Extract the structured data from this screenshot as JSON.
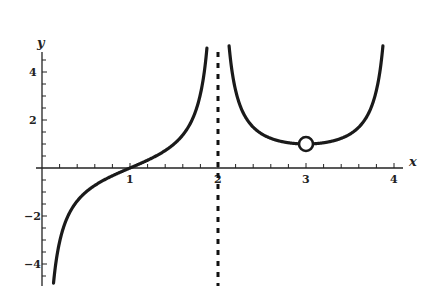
{
  "chart_data": {
    "type": "line",
    "title": "",
    "xlabel": "x",
    "ylabel": "y",
    "xlim": [
      0,
      4.1
    ],
    "ylim": [
      -5,
      5
    ],
    "grid": false,
    "x_ticks": [
      1,
      2,
      3,
      4
    ],
    "x_tick_labels": [
      "1",
      "2",
      "3",
      "4"
    ],
    "y_ticks": [
      -4,
      -2,
      2,
      4
    ],
    "y_tick_labels": [
      "-4",
      "-2",
      "2",
      "4"
    ],
    "series": [
      {
        "name": "left branch",
        "domain": [
          0,
          2
        ],
        "points": [
          [
            0.04,
            -5.0
          ],
          [
            0.1,
            -6.31
          ],
          [
            0.2,
            -3.08
          ],
          [
            0.3,
            -1.96
          ],
          [
            0.4,
            -1.38
          ],
          [
            0.5,
            -1.0
          ],
          [
            0.6,
            -0.73
          ],
          [
            0.7,
            -0.51
          ],
          [
            0.8,
            -0.32
          ],
          [
            0.9,
            -0.16
          ],
          [
            1.0,
            0.0
          ],
          [
            1.1,
            0.16
          ],
          [
            1.2,
            0.32
          ],
          [
            1.3,
            0.51
          ],
          [
            1.4,
            0.73
          ],
          [
            1.5,
            1.0
          ],
          [
            1.6,
            1.38
          ],
          [
            1.7,
            1.96
          ],
          [
            1.8,
            3.08
          ],
          [
            1.86,
            4.5
          ],
          [
            1.88,
            5.0
          ]
        ]
      },
      {
        "name": "right branch",
        "domain": [
          2,
          4
        ],
        "points": [
          [
            2.12,
            5.0
          ],
          [
            2.2,
            3.24
          ],
          [
            2.3,
            2.2
          ],
          [
            2.4,
            1.7
          ],
          [
            2.5,
            1.41
          ],
          [
            2.6,
            1.24
          ],
          [
            2.7,
            1.12
          ],
          [
            2.8,
            1.05
          ],
          [
            2.9,
            1.01
          ],
          [
            3.0,
            1.0
          ],
          [
            3.1,
            1.01
          ],
          [
            3.2,
            1.05
          ],
          [
            3.3,
            1.12
          ],
          [
            3.4,
            1.24
          ],
          [
            3.5,
            1.41
          ],
          [
            3.6,
            1.7
          ],
          [
            3.7,
            2.2
          ],
          [
            3.8,
            3.24
          ],
          [
            3.88,
            5.0
          ]
        ]
      }
    ],
    "annotations": [
      {
        "type": "vertical-asymptote",
        "x": 2,
        "style": "dashed"
      },
      {
        "type": "open-circle",
        "x": 3,
        "y": 1
      }
    ]
  },
  "axes": {
    "x_label": "x",
    "y_label": "y",
    "x_ticks": [
      "1",
      "2",
      "3",
      "4"
    ],
    "y_ticks": [
      "4",
      "2",
      "-2",
      "-4"
    ]
  }
}
